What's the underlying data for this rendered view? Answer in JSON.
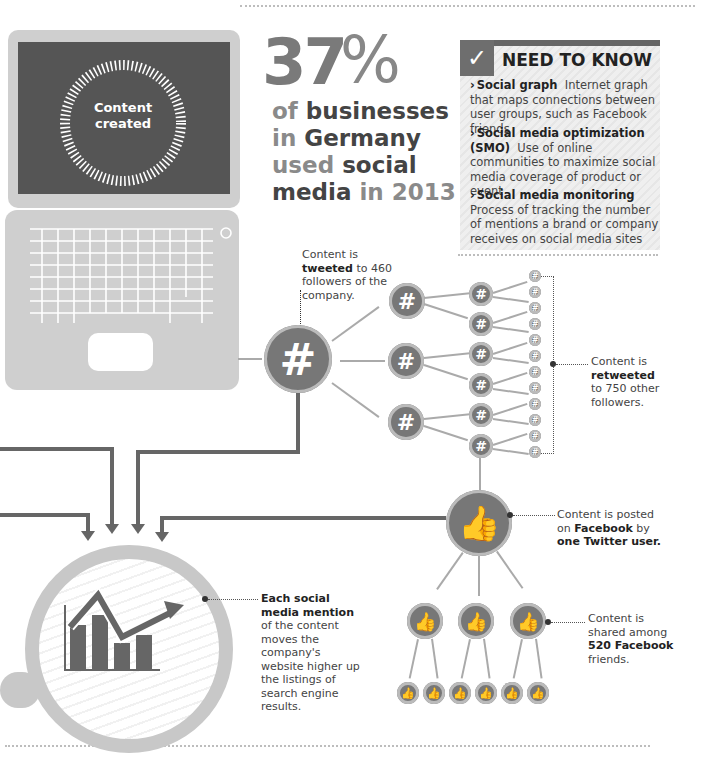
{
  "laptop": {
    "screen_label_line1": "Content",
    "screen_label_line2": "created"
  },
  "headline": {
    "percent_number": "37",
    "percent_sign": "%",
    "line1_a": "of",
    "line1_b": " businesses",
    "line2_a": "in",
    "line2_b": " Germany",
    "line3_a": "used",
    "line3_b": " social",
    "line4_a": "media",
    "line4_b": " in 2013"
  },
  "need_to_know": {
    "title": "NEED TO KNOW",
    "check_icon": "✓",
    "items": [
      {
        "term": "Social graph",
        "definition": "Internet graph that maps connections between user groups, such as Facebook friends"
      },
      {
        "term": "Social media optimization (SMO)",
        "definition": "Use of online communities to maximize social media coverage of product or event"
      },
      {
        "term": "Social media monitoring",
        "definition": "Process of tracking the number of mentions a brand or company receives on social media sites"
      }
    ]
  },
  "annotations": {
    "tweeted_pre": "Content is ",
    "tweeted_bold": "tweeted",
    "tweeted_post": " to 460 followers of the company.",
    "retweeted_pre": "Content is ",
    "retweeted_bold": "retweeted",
    "retweeted_post": " to 750 other followers.",
    "facebook_pre": "Content is posted on ",
    "facebook_bold1": "Facebook",
    "facebook_mid": " by ",
    "facebook_bold2": "one Twitter user.",
    "shared_pre": "Content is shared among ",
    "shared_bold": "520 Facebook",
    "shared_post": " friends.",
    "seo_bold": "Each social media mention",
    "seo_post": " of the content moves the company's website higher up the listings of search engine results."
  },
  "icons": {
    "hashtag": "#",
    "thumbs_up": "👍"
  },
  "colors": {
    "dark_gray": "#666666",
    "mid_gray": "#777777",
    "light_gray": "#cfcfcf"
  }
}
